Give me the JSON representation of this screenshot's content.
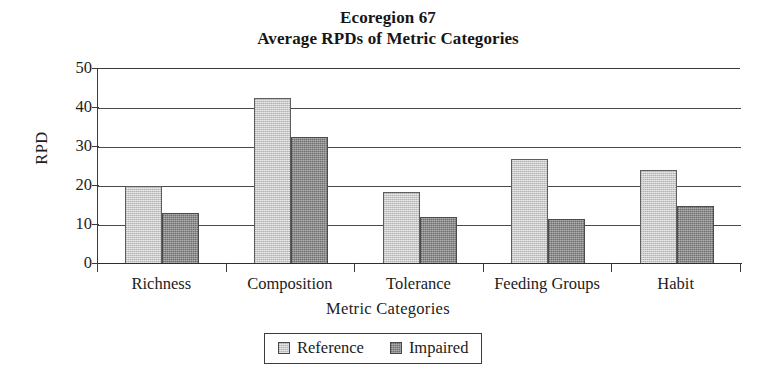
{
  "chart_data": {
    "type": "bar",
    "title": "Ecoregion 67",
    "subtitle": "Average RPDs of Metric Categories",
    "xlabel": "Metric Categories",
    "ylabel": "RPD",
    "ylim": [
      0,
      50
    ],
    "ytick_labels": [
      "50",
      "40",
      "30",
      "20",
      "10",
      "0"
    ],
    "ytick_values": [
      50,
      40,
      30,
      20,
      10,
      0
    ],
    "grid": true,
    "legend_position": "bottom",
    "categories": [
      "Richness",
      "Composition",
      "Tolerance",
      "Feeding Groups",
      "Habit"
    ],
    "series": [
      {
        "name": "Reference",
        "color": "#c9c9c9",
        "values": [
          20,
          42.5,
          18.5,
          27,
          24
        ]
      },
      {
        "name": "Impaired",
        "color": "#8d8d8d",
        "values": [
          13,
          32.5,
          12,
          11.5,
          15
        ]
      }
    ]
  },
  "legend": {
    "entries": [
      {
        "label": "Reference"
      },
      {
        "label": "Impaired"
      }
    ]
  }
}
